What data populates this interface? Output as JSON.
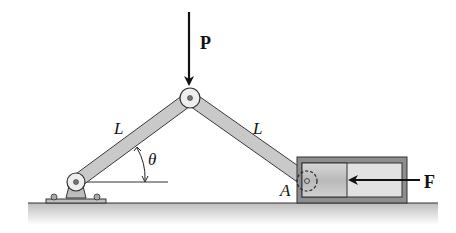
{
  "diagram": {
    "type": "toggle-linkage mechanics figure",
    "labels": {
      "load": "P",
      "force": "F",
      "left_link": "L",
      "right_link": "L",
      "angle": "θ",
      "point_a": "A"
    },
    "colors": {
      "link_fill": "#c9c9c9",
      "link_stroke": "#3a3a3a",
      "cylinder_outer": "#8e8e8e",
      "cylinder_inner": "#e2e2e2",
      "ground": "#cfcfcf",
      "ink": "#111111"
    }
  }
}
